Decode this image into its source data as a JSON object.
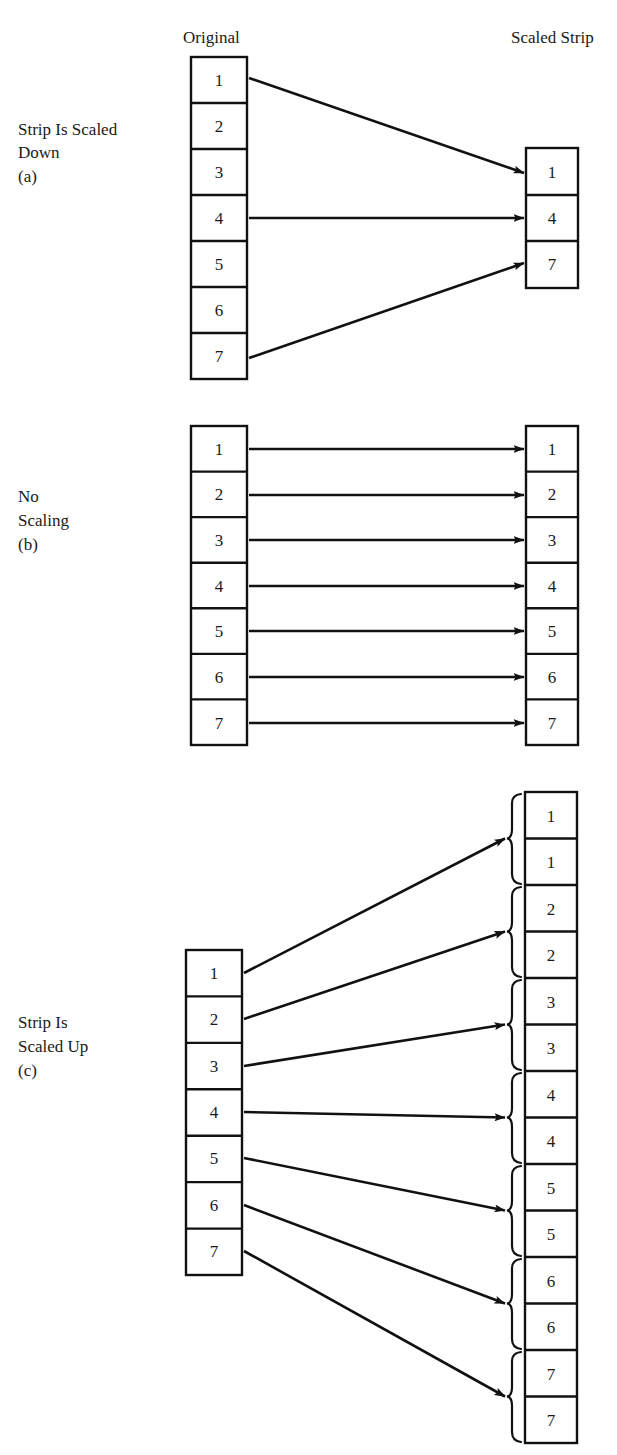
{
  "figure": {
    "headers": {
      "original": "Original",
      "scaled": "Scaled Strip"
    },
    "panels": [
      {
        "id": "a",
        "label_lines": [
          "Strip Is Scaled",
          "Down"
        ],
        "caption": "(a)",
        "original_cells": [
          "1",
          "2",
          "3",
          "4",
          "5",
          "6",
          "7"
        ],
        "scaled_cells": [
          "1",
          "4",
          "7"
        ],
        "mappings": [
          {
            "from": "1",
            "to": "1"
          },
          {
            "from": "4",
            "to": "4"
          },
          {
            "from": "7",
            "to": "7"
          }
        ],
        "braces": false
      },
      {
        "id": "b",
        "label_lines": [
          "No",
          "Scaling"
        ],
        "caption": "(b)",
        "original_cells": [
          "1",
          "2",
          "3",
          "4",
          "5",
          "6",
          "7"
        ],
        "scaled_cells": [
          "1",
          "2",
          "3",
          "4",
          "5",
          "6",
          "7"
        ],
        "mappings": [
          {
            "from": "1",
            "to": "1"
          },
          {
            "from": "2",
            "to": "2"
          },
          {
            "from": "3",
            "to": "3"
          },
          {
            "from": "4",
            "to": "4"
          },
          {
            "from": "5",
            "to": "5"
          },
          {
            "from": "6",
            "to": "6"
          },
          {
            "from": "7",
            "to": "7"
          }
        ],
        "braces": false
      },
      {
        "id": "c",
        "label_lines": [
          "Strip Is",
          "Scaled Up"
        ],
        "caption": "(c)",
        "original_cells": [
          "1",
          "2",
          "3",
          "4",
          "5",
          "6",
          "7"
        ],
        "scaled_cells": [
          "1",
          "1",
          "2",
          "2",
          "3",
          "3",
          "4",
          "4",
          "5",
          "5",
          "6",
          "6",
          "7",
          "7"
        ],
        "mappings": [
          {
            "from": "1",
            "to": "1"
          },
          {
            "from": "2",
            "to": "2"
          },
          {
            "from": "3",
            "to": "3"
          },
          {
            "from": "4",
            "to": "4"
          },
          {
            "from": "5",
            "to": "5"
          },
          {
            "from": "6",
            "to": "6"
          },
          {
            "from": "7",
            "to": "7"
          }
        ],
        "braces": true,
        "brace_groups": 7
      }
    ],
    "colors": {
      "ink": "#111111",
      "paper": "#ffffff"
    }
  }
}
